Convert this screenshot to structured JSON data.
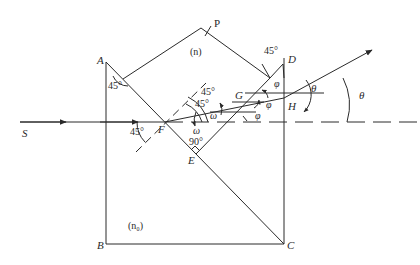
{
  "diagram": {
    "type": "optics-prism-refraction",
    "line_color": "#2a2a2a",
    "points": {
      "A": "A",
      "B": "B",
      "C": "C",
      "D": "D",
      "E": "E",
      "F": "F",
      "G": "G",
      "H": "H",
      "P": "P",
      "S": "S"
    },
    "media": {
      "prism": "(n)",
      "block": "(n₀)"
    },
    "angles": {
      "angle_A": "45°",
      "angle_F_incident": "45°",
      "angle_E_right": "90°",
      "angle_prism_45_outer": "45°",
      "angle_prism_45_inner": "45°",
      "angle_top_right": "45°",
      "omega_1": "ω",
      "omega_2": "ω",
      "phi_1": "φ",
      "phi_2": "φ",
      "phi_3": "φ",
      "theta_1": "θ",
      "theta_2": "θ"
    }
  }
}
